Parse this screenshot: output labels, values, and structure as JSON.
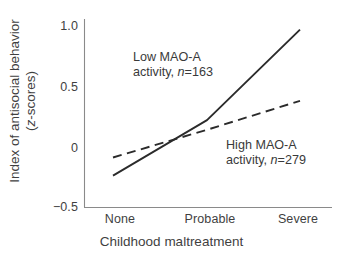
{
  "chart_data": {
    "type": "line",
    "title": "",
    "xlabel": "Childhood maltreatment",
    "ylabel_line1": "Index of antisocial behavior",
    "ylabel_line2_prefix": "(",
    "ylabel_line2_italic": "z",
    "ylabel_line2_suffix": "-scores)",
    "categories": [
      "None",
      "Probable",
      "Severe"
    ],
    "x_positions": [
      0,
      1,
      2
    ],
    "ylim": [
      -0.5,
      1.0
    ],
    "yticks": [
      -0.5,
      0,
      0.5,
      1.0
    ],
    "ytick_labels": [
      "−0.5",
      "0",
      "0.5",
      "1.0"
    ],
    "grid": false,
    "legend": "inline-annotations",
    "series": [
      {
        "name": "Low MAO-A activity",
        "n": 163,
        "style": "solid",
        "color": "#2b2b2b",
        "values": [
          -0.24,
          0.22,
          0.97
        ]
      },
      {
        "name": "High MAO-A activity",
        "n": 279,
        "style": "dashed",
        "color": "#2b2b2b",
        "values": [
          -0.09,
          0.14,
          0.38
        ]
      }
    ],
    "annotations": [
      {
        "id": "low",
        "line1": "Low MAO-A",
        "line2_prefix": "activity, ",
        "line2_italic": "n",
        "line2_suffix": "=163"
      },
      {
        "id": "high",
        "line1": "High MAO-A",
        "line2_prefix": "activity, ",
        "line2_italic": "n",
        "line2_suffix": "=279"
      }
    ]
  },
  "axes": {
    "y_tick_0": "1.0",
    "y_tick_1": "0.5",
    "y_tick_2": "0",
    "y_tick_3": "−0.5",
    "x_tick_0": "None",
    "x_tick_1": "Probable",
    "x_tick_2": "Severe"
  }
}
